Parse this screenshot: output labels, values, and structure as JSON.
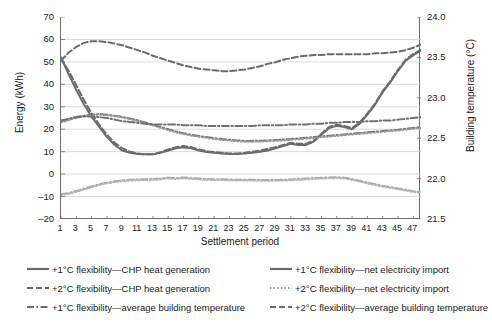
{
  "chart_data": {
    "type": "line",
    "title": "",
    "xlabel": "Settlement period",
    "ylabel": "Energy (kWh)",
    "ylabel_secondary": "Building temperature (°C)",
    "ylim": [
      -20,
      70
    ],
    "ytick_labels": [
      "70",
      "60",
      "50",
      "40",
      "30",
      "20",
      "10",
      "0",
      "–10",
      "–20"
    ],
    "ytick_values": [
      70,
      60,
      50,
      40,
      30,
      20,
      10,
      0,
      -10,
      -20
    ],
    "ylim_secondary": [
      21.5,
      24.0
    ],
    "ytick_labels_secondary": [
      "24.0",
      "23.5",
      "23.0",
      "22.5",
      "22.0",
      "21.5"
    ],
    "ytick_values_secondary": [
      24.0,
      23.5,
      23.0,
      22.5,
      22.0,
      21.5
    ],
    "xlim": [
      1,
      48
    ],
    "xtick_labels": [
      "1",
      "3",
      "5",
      "7",
      "9",
      "11",
      "13",
      "15",
      "17",
      "19",
      "21",
      "23",
      "25",
      "27",
      "29",
      "31",
      "33",
      "35",
      "37",
      "39",
      "41",
      "43",
      "45",
      "47"
    ],
    "xtick_values": [
      1,
      3,
      5,
      7,
      9,
      11,
      13,
      15,
      17,
      19,
      21,
      23,
      25,
      27,
      29,
      31,
      33,
      35,
      37,
      39,
      41,
      43,
      45,
      47
    ],
    "grid": "horizontal",
    "legend_position": "below-plot",
    "x": [
      1,
      2,
      3,
      4,
      5,
      6,
      7,
      8,
      9,
      10,
      11,
      12,
      13,
      14,
      15,
      16,
      17,
      18,
      19,
      20,
      21,
      22,
      23,
      24,
      25,
      26,
      27,
      28,
      29,
      30,
      31,
      32,
      33,
      34,
      35,
      36,
      37,
      38,
      39,
      40,
      41,
      42,
      43,
      44,
      45,
      46,
      47,
      48
    ],
    "series": [
      {
        "name": "+1°C flexibility—CHP heat generation",
        "axis": "left",
        "style": "solid",
        "color": "#6b6b6b",
        "values": [
          52.0,
          44.5,
          37.5,
          31.0,
          25.5,
          21.0,
          16.5,
          13.0,
          10.5,
          9.5,
          9.0,
          8.8,
          8.8,
          9.5,
          10.5,
          11.5,
          12.0,
          11.5,
          10.5,
          9.8,
          9.5,
          9.2,
          9.0,
          9.0,
          9.2,
          9.5,
          10.0,
          10.5,
          11.5,
          12.5,
          13.5,
          13.0,
          13.0,
          14.5,
          17.5,
          20.5,
          21.5,
          21.0,
          20.0,
          22.5,
          26.5,
          31.0,
          36.5,
          41.0,
          46.0,
          50.5,
          53.0,
          55.0
        ]
      },
      {
        "name": "+1°C flexibility—net electricity import",
        "axis": "left",
        "style": "dashdot",
        "color": "#7a7a7a",
        "values": [
          23.5,
          24.5,
          25.5,
          26.0,
          26.5,
          26.8,
          26.5,
          26.0,
          25.5,
          24.8,
          24.0,
          23.0,
          22.0,
          21.0,
          20.0,
          19.0,
          18.2,
          17.5,
          17.0,
          16.5,
          16.0,
          15.6,
          15.3,
          15.0,
          14.8,
          14.8,
          14.9,
          15.0,
          15.2,
          15.4,
          15.6,
          15.9,
          16.2,
          16.5,
          16.8,
          17.1,
          17.4,
          17.7,
          18.0,
          18.3,
          18.6,
          18.9,
          19.2,
          19.5,
          19.8,
          20.2,
          20.6,
          21.0
        ]
      },
      {
        "name": "+2°C flexibility—CHP heat generation",
        "axis": "left",
        "style": "dashed",
        "color": "#6b6b6b",
        "values": [
          51.5,
          46.0,
          39.5,
          33.0,
          27.0,
          22.0,
          17.5,
          14.0,
          11.5,
          10.0,
          9.2,
          8.8,
          8.8,
          9.8,
          11.0,
          12.0,
          12.5,
          12.0,
          11.0,
          10.2,
          9.8,
          9.5,
          9.2,
          9.2,
          9.5,
          10.0,
          10.5,
          11.2,
          12.0,
          13.0,
          14.0,
          13.5,
          13.5,
          15.0,
          18.0,
          21.0,
          22.0,
          21.5,
          20.5,
          23.0,
          27.0,
          31.5,
          37.0,
          41.5,
          46.5,
          51.0,
          53.5,
          55.5
        ]
      },
      {
        "name": "+2°C flexibility—net electricity import",
        "axis": "left",
        "style": "dotted",
        "color": "#9a9a9a",
        "values": [
          23.0,
          24.0,
          25.0,
          25.8,
          26.2,
          26.5,
          26.2,
          25.8,
          25.2,
          24.5,
          23.6,
          22.6,
          21.6,
          20.6,
          19.6,
          18.6,
          17.8,
          17.1,
          16.6,
          16.1,
          15.6,
          15.2,
          14.9,
          14.6,
          14.4,
          14.4,
          14.5,
          14.6,
          14.8,
          15.0,
          15.2,
          15.5,
          15.8,
          16.1,
          16.4,
          16.7,
          17.0,
          17.3,
          17.6,
          17.9,
          18.2,
          18.5,
          18.8,
          19.1,
          19.4,
          19.8,
          20.2,
          20.6
        ]
      },
      {
        "name": "+1°C flexibility—average building temperature",
        "axis": "right",
        "style": "dashdot",
        "color": "#707070",
        "values": [
          22.72,
          22.74,
          22.76,
          22.77,
          22.77,
          22.76,
          22.75,
          22.73,
          22.71,
          22.7,
          22.69,
          22.68,
          22.67,
          22.67,
          22.67,
          22.67,
          22.66,
          22.66,
          22.66,
          22.65,
          22.65,
          22.65,
          22.65,
          22.65,
          22.65,
          22.65,
          22.66,
          22.66,
          22.66,
          22.66,
          22.67,
          22.67,
          22.67,
          22.68,
          22.68,
          22.69,
          22.69,
          22.7,
          22.7,
          22.7,
          22.71,
          22.71,
          22.72,
          22.72,
          22.73,
          22.74,
          22.75,
          22.76
        ]
      },
      {
        "name": "+2°C flexibility—average building temperature",
        "axis": "right",
        "style": "dashed",
        "color": "#6b6b6b",
        "values": [
          23.46,
          23.56,
          23.63,
          23.68,
          23.7,
          23.7,
          23.69,
          23.67,
          23.65,
          23.62,
          23.59,
          23.56,
          23.52,
          23.49,
          23.46,
          23.43,
          23.4,
          23.38,
          23.36,
          23.35,
          23.34,
          23.33,
          23.33,
          23.34,
          23.35,
          23.37,
          23.39,
          23.42,
          23.44,
          23.47,
          23.49,
          23.51,
          23.52,
          23.53,
          23.53,
          23.54,
          23.54,
          23.54,
          23.54,
          23.54,
          23.54,
          23.55,
          23.55,
          23.56,
          23.57,
          23.59,
          23.62,
          23.66
        ]
      },
      {
        "name": "+1°C flexibility—net electricity import (low band)",
        "axis": "left",
        "style": "dashdot",
        "color": "#a8a8a8",
        "values": [
          -9.0,
          -8.5,
          -7.5,
          -6.5,
          -5.5,
          -4.5,
          -3.8,
          -3.2,
          -2.8,
          -2.5,
          -2.4,
          -2.3,
          -2.2,
          -2.0,
          -1.6,
          -1.8,
          -1.5,
          -1.8,
          -2.0,
          -2.2,
          -2.3,
          -2.3,
          -2.4,
          -2.5,
          -2.5,
          -2.5,
          -2.6,
          -2.6,
          -2.6,
          -2.5,
          -2.4,
          -2.2,
          -2.0,
          -1.8,
          -1.6,
          -1.5,
          -1.4,
          -1.6,
          -2.2,
          -3.0,
          -3.8,
          -4.5,
          -5.2,
          -5.8,
          -6.4,
          -7.0,
          -7.6,
          -8.0
        ]
      },
      {
        "name": "+2°C flexibility—net electricity import (low band)",
        "axis": "left",
        "style": "dotted",
        "color": "#b5b5b5",
        "values": [
          -9.4,
          -8.9,
          -7.9,
          -6.9,
          -5.9,
          -4.9,
          -4.2,
          -3.6,
          -3.2,
          -2.9,
          -2.8,
          -2.7,
          -2.6,
          -2.4,
          -2.0,
          -2.2,
          -1.9,
          -2.2,
          -2.4,
          -2.6,
          -2.7,
          -2.7,
          -2.8,
          -2.9,
          -2.9,
          -2.9,
          -3.0,
          -3.0,
          -3.0,
          -2.9,
          -2.8,
          -2.6,
          -2.4,
          -2.2,
          -2.0,
          -1.9,
          -1.8,
          -2.0,
          -2.6,
          -3.4,
          -4.2,
          -4.9,
          -5.6,
          -6.2,
          -6.8,
          -7.4,
          -8.0,
          -8.4
        ]
      }
    ]
  },
  "axes": {
    "left_title": "Energy (kWh)",
    "right_title": "Building temperature (°C)",
    "x_title": "Settlement period"
  },
  "legend": {
    "items": [
      {
        "label": "+1°C flexibility—CHP heat generation",
        "style": "solid",
        "color": "#6b6b6b",
        "column": "left",
        "row": 0
      },
      {
        "label": "+2°C flexibility—CHP heat generation",
        "style": "dashed",
        "color": "#6b6b6b",
        "column": "left",
        "row": 1
      },
      {
        "label": "+1°C flexibility—average building temperature",
        "style": "dashdot",
        "color": "#6b6b6b",
        "column": "left",
        "row": 2
      },
      {
        "label": "+1°C flexibility—net electricity import",
        "style": "solid",
        "color": "#6b6b6b",
        "column": "right",
        "row": 0
      },
      {
        "label": "+2°C flexibility—net electricity import",
        "style": "dotted",
        "color": "#9a9a9a",
        "column": "right",
        "row": 1
      },
      {
        "label": "+2°C flexibility—average building temperature",
        "style": "dashed",
        "color": "#6b6b6b",
        "column": "right",
        "row": 2
      }
    ]
  }
}
